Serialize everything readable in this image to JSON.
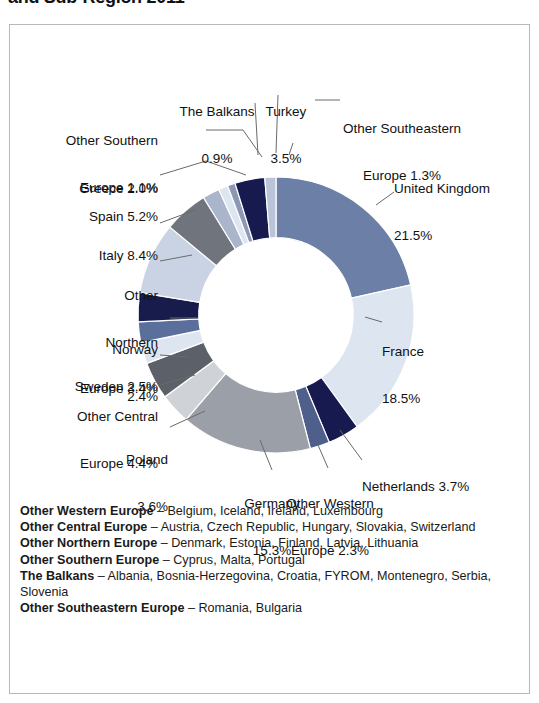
{
  "title": "and Sub-Region 2011",
  "chart_data": {
    "type": "pie",
    "title": "and Sub-Region 2011",
    "subtitle": "",
    "xlabel": "",
    "ylabel": "",
    "legend_position": "callout-labels",
    "grid": false,
    "hole_ratio": 0.56,
    "start_angle_deg": 0,
    "direction": "clockwise",
    "categories": [
      "United Kingdom",
      "France",
      "Netherlands",
      "Other Western Europe",
      "Germany",
      "Poland",
      "Other Central Europe",
      "Sweden",
      "Norway",
      "Other Northern Europe",
      "Italy",
      "Spain",
      "Greece",
      "Other Southern Europe",
      "The Balkans",
      "Turkey",
      "Other Southeastern Europe"
    ],
    "values": [
      21.5,
      18.5,
      3.7,
      2.3,
      15.3,
      3.6,
      4.4,
      2.5,
      2.4,
      3.4,
      8.4,
      5.2,
      2.0,
      1.1,
      0.9,
      3.5,
      1.3
    ],
    "unit": "%",
    "colors": [
      "#6b7fa7",
      "#dde5f1",
      "#161a4e",
      "#4e5f8c",
      "#9ba0a8",
      "#cfd2d6",
      "#5c6069",
      "#dde5f1",
      "#5b6f9c",
      "#181c4c",
      "#c9d3e4",
      "#70747c",
      "#aab5cb",
      "#dde5f1",
      "#8c99b5",
      "#161a4e",
      "#b9c4d8"
    ]
  },
  "labels": [
    {
      "key": "the-balkans",
      "name": "The Balkans",
      "pct": "0.9%",
      "line1": "The Balkans",
      "line2": "0.9%"
    },
    {
      "key": "turkey",
      "name": "Turkey",
      "pct": "3.5%",
      "line1": "Turkey",
      "line2": "3.5%"
    },
    {
      "key": "other-southeastern",
      "name": "Other Southeastern",
      "pct": "1.3%",
      "line1": "Other Southeastern",
      "line2": "Europe 1.3%"
    },
    {
      "key": "other-southern",
      "name": "Other Southern",
      "pct": "1.1%",
      "line1": "Other Southern",
      "line2": "Europe 1.1%"
    },
    {
      "key": "greece",
      "name": "Greece",
      "pct": "2.0%",
      "line1": "Greece 2.0%",
      "line2": ""
    },
    {
      "key": "spain",
      "name": "Spain",
      "pct": "5.2%",
      "line1": "Spain 5.2%",
      "line2": ""
    },
    {
      "key": "italy",
      "name": "Italy",
      "pct": "8.4%",
      "line1": "Italy 8.4%",
      "line2": ""
    },
    {
      "key": "other-northern",
      "name": "Other Northern Europe",
      "pct": "3.4%",
      "line1": "Other",
      "line2": "Northern",
      "line3": "Europe 3.4%"
    },
    {
      "key": "norway",
      "name": "Norway",
      "pct": "2.4%",
      "line1": "Norway",
      "line2": "2.4%"
    },
    {
      "key": "sweden",
      "name": "Sweden",
      "pct": "2.5%",
      "line1": "Sweden 2.5%",
      "line2": ""
    },
    {
      "key": "other-central",
      "name": "Other Central Europe",
      "pct": "4.4%",
      "line1": "Other Central",
      "line2": "Europe 4.4%"
    },
    {
      "key": "poland",
      "name": "Poland",
      "pct": "3.6%",
      "line1": "Poland",
      "line2": "3.6%"
    },
    {
      "key": "germany",
      "name": "Germany",
      "pct": "15.3%",
      "line1": "Germany",
      "line2": "15.3%"
    },
    {
      "key": "other-western",
      "name": "Other Western Europe",
      "pct": "2.3%",
      "line1": "Other Western",
      "line2": "Europe 2.3%"
    },
    {
      "key": "netherlands",
      "name": "Netherlands",
      "pct": "3.7%",
      "line1": "Netherlands 3.7%",
      "line2": ""
    },
    {
      "key": "france",
      "name": "France",
      "pct": "18.5%",
      "line1": "France",
      "line2": "18.5%"
    },
    {
      "key": "united-kingdom",
      "name": "United Kingdom",
      "pct": "21.5%",
      "line1": "United Kingdom",
      "line2": "21.5%"
    }
  ],
  "legend": [
    {
      "term": "Other Western Europe",
      "def": " – Belgium, Iceland, Ireland, Luxembourg"
    },
    {
      "term": "Other Central Europe",
      "def": " – Austria, Czech Republic, Hungary, Slovakia, Switzerland"
    },
    {
      "term": "Other Northern Europe",
      "def": " – Denmark, Estonia, Finland, Latvia, Lithuania"
    },
    {
      "term": "Other Southern Europe",
      "def": " – Cyprus, Malta, Portugal"
    },
    {
      "term": "The Balkans",
      "def": " – Albania, Bosnia-Herzegovina, Croatia, FYROM, Montenegro, Serbia, Slovenia"
    },
    {
      "term": "Other Southeastern Europe",
      "def": " – Romania, Bulgaria"
    }
  ]
}
